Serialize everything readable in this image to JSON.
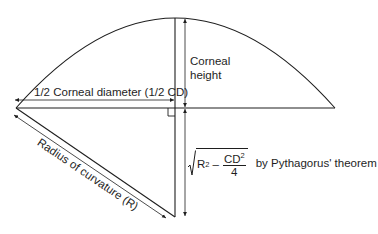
{
  "diagram": {
    "colors": {
      "line": "#1e1e1e",
      "background": "#ffffff"
    },
    "labels": {
      "half_diameter": "1/2 Corneal diameter (1/2 CD)",
      "corneal_height_line1": "Corneal",
      "corneal_height_line2": "height",
      "radius": "Radius of curvature (R)",
      "formula_r": "R",
      "formula_r_exp": "2",
      "formula_minus": "–",
      "formula_cd": "CD",
      "formula_cd_exp": "2",
      "formula_den": "4",
      "formula_note": "by Pythagorus' theorem"
    }
  }
}
